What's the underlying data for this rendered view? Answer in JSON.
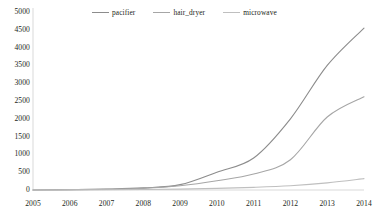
{
  "chart_data": {
    "type": "line",
    "title": "",
    "subtitle": "",
    "xlabel": "",
    "ylabel": "",
    "xlim": [
      2005,
      2014
    ],
    "ylim": [
      0,
      5000
    ],
    "grid": false,
    "legend_position": "top-center",
    "x": [
      2005,
      2006,
      2007,
      2008,
      2009,
      2010,
      2011,
      2012,
      2013,
      2014
    ],
    "categories": [
      "2005",
      "2006",
      "2007",
      "2008",
      "2009",
      "2010",
      "2011",
      "2012",
      "2013",
      "2014"
    ],
    "y_ticks": [
      0,
      500,
      1000,
      1500,
      2000,
      2500,
      3000,
      3500,
      4000,
      4500,
      5000
    ],
    "y_tick_labels": [
      "0",
      "500",
      "1000",
      "1500",
      "2000",
      "2500",
      "3000",
      "3500",
      "4000",
      "4500",
      "5000"
    ],
    "series": [
      {
        "name": "pacifier",
        "color": "#8c8c8c",
        "values": [
          0,
          10,
          25,
          60,
          150,
          500,
          900,
          2000,
          3500,
          4550
        ]
      },
      {
        "name": "hair_dryer",
        "color": "#a6a6a6",
        "values": [
          0,
          8,
          20,
          45,
          120,
          260,
          450,
          850,
          2050,
          2620
        ]
      },
      {
        "name": "microwave",
        "color": "#bfbfbf",
        "values": [
          0,
          3,
          6,
          12,
          25,
          45,
          75,
          120,
          200,
          320
        ]
      }
    ]
  },
  "legend": {
    "entries": [
      {
        "label": "pacifier"
      },
      {
        "label": "hair_dryer"
      },
      {
        "label": "microwave"
      }
    ]
  },
  "axes": {
    "y_axis_color": "#d9d9d9",
    "x_axis_color": "#d9d9d9"
  }
}
